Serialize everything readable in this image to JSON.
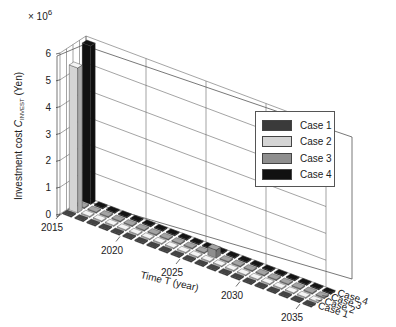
{
  "chart_data": {
    "type": "bar3d",
    "title": "",
    "ylabel": "Investment cost C_INVEST (Yen)",
    "ylabel_main": "Investment cost ",
    "ylabel_symbol": "C",
    "ylabel_subscript": "INVEST",
    "ylabel_unit": " (Yen)",
    "y_multiplier": "× 10",
    "y_multiplier_exp": "6",
    "xlabel": "Time T (year)",
    "ylim": [
      0,
      6000000
    ],
    "y_ticks": [
      "0",
      "1",
      "2",
      "3",
      "4",
      "5",
      "6"
    ],
    "x_ticks": [
      "2015",
      "2020",
      "2025",
      "2030",
      "2035"
    ],
    "depth_ticks": [
      "Case 1",
      "Case 2",
      "Case 3",
      "Case 4"
    ],
    "x": [
      2015,
      2016,
      2017,
      2018,
      2019,
      2020,
      2021,
      2022,
      2023,
      2024,
      2025,
      2026,
      2027,
      2028,
      2029,
      2030,
      2031,
      2032,
      2033,
      2034,
      2035
    ],
    "series": [
      {
        "name": "Case 1",
        "color": "#3a3a3a",
        "values": [
          0,
          0,
          0,
          0,
          0,
          0,
          0,
          0,
          0,
          0,
          0,
          0,
          0,
          0,
          0,
          0,
          0,
          0,
          0,
          0,
          0
        ]
      },
      {
        "name": "Case 2",
        "color": "#d4d4d4",
        "values": [
          5400000,
          0,
          0,
          0,
          0,
          0,
          0,
          0,
          0,
          0,
          0,
          0,
          0,
          0,
          0,
          0,
          0,
          0,
          0,
          0,
          0
        ]
      },
      {
        "name": "Case 3",
        "color": "#8e8e8e",
        "values": [
          0,
          0,
          0,
          0,
          0,
          0,
          0,
          0,
          0,
          0,
          0,
          300000,
          0,
          0,
          0,
          0,
          0,
          0,
          0,
          0,
          0
        ]
      },
      {
        "name": "Case 4",
        "color": "#111111",
        "values": [
          5900000,
          0,
          0,
          0,
          0,
          0,
          0,
          0,
          0,
          0,
          0,
          0,
          0,
          0,
          0,
          0,
          0,
          0,
          0,
          0,
          0
        ]
      }
    ],
    "legend_position": "upper right inside",
    "grid": true
  },
  "legend": {
    "items": [
      {
        "label": "Case 1",
        "color": "#3a3a3a"
      },
      {
        "label": "Case 2",
        "color": "#d4d4d4"
      },
      {
        "label": "Case 3",
        "color": "#8e8e8e"
      },
      {
        "label": "Case 4",
        "color": "#111111"
      }
    ]
  }
}
